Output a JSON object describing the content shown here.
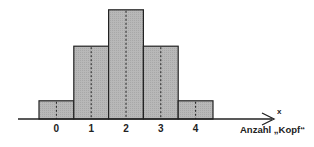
{
  "chart_data": {
    "type": "bar",
    "title": "",
    "categories": [
      "0",
      "1",
      "2",
      "3",
      "4"
    ],
    "values": [
      0.0625,
      0.25,
      0.375,
      0.25,
      0.0625
    ],
    "relative_heights": [
      1,
      4,
      6,
      4,
      1
    ],
    "xlabel": "Anzahl „Kopf“",
    "axis_variable": "x",
    "ylabel": "",
    "grid": false,
    "legend": null,
    "bar_style": "histogram, adjacent bars, grey fill, dashed center lines"
  },
  "colors": {
    "bar_fill": "#b4b4b4",
    "bar_stroke": "#222222",
    "axis": "#222222"
  }
}
